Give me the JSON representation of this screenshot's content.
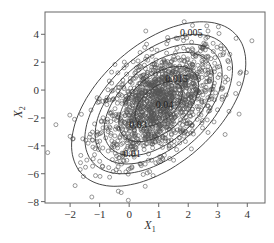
{
  "chart_data": {
    "type": "scatter",
    "title": "",
    "xlabel": "X",
    "xlabel_sub": "1",
    "ylabel": "X",
    "ylabel_sub": "2",
    "xlim": [
      -2.85,
      4.6
    ],
    "ylim": [
      -8.1,
      5.6
    ],
    "x_ticks": [
      -2,
      -1,
      0,
      1,
      2,
      3,
      4
    ],
    "y_ticks": [
      -8,
      -6,
      -4,
      -2,
      0,
      2,
      4
    ],
    "x_tick_labels": [
      "−2",
      "−1",
      "0",
      "1",
      "2",
      "3",
      "4"
    ],
    "y_tick_labels": [
      "−8",
      "−6",
      "−4",
      "−2",
      "0",
      "2",
      "4"
    ],
    "grid": false,
    "legend": null,
    "marker": "open-circle",
    "marker_color": "#555555",
    "series": [
      {
        "name": "samples",
        "distribution": "bivariate normal",
        "mean": [
          1.0,
          -1.0
        ],
        "std": [
          1.0,
          2.0
        ],
        "correlation": 0.5,
        "n_points": 1500
      }
    ],
    "contours": [
      {
        "level": "0.005",
        "label": "0.005",
        "label_pos": [
          2.1,
          3.9
        ]
      },
      {
        "level": "0.01",
        "label": "0.01",
        "label_pos": [
          0.1,
          -4.8
        ]
      },
      {
        "level": "0.015",
        "label": "0.015",
        "label_pos": [
          1.6,
          0.6
        ]
      },
      {
        "level": "0.02",
        "label": "",
        "label_pos": null
      },
      {
        "level": "0.03",
        "label": "0.03",
        "label_pos": [
          0.3,
          -2.7
        ]
      },
      {
        "level": "0.04",
        "label": "0.04",
        "label_pos": [
          1.2,
          -1.3
        ]
      }
    ]
  }
}
